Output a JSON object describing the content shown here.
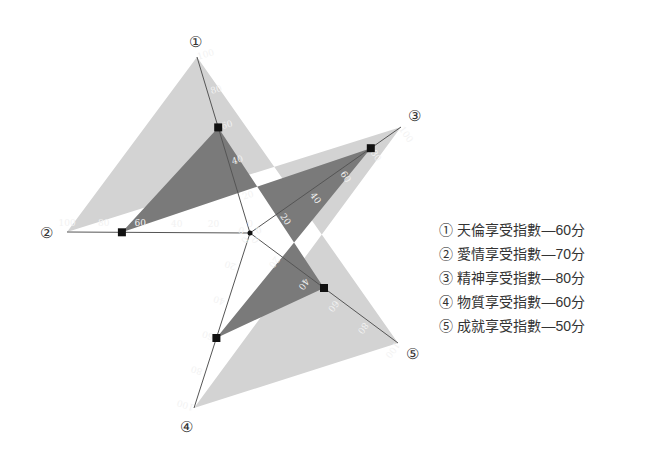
{
  "chart_data": {
    "type": "radar",
    "title": "",
    "categories": [
      "天倫享受指數",
      "愛情享受指數",
      "精神享受指數",
      "物質享受指數",
      "成就享受指數"
    ],
    "axis_markers": [
      "①",
      "②",
      "③",
      "④",
      "⑤"
    ],
    "series": [
      {
        "name": "享受指數",
        "values": [
          60,
          70,
          80,
          60,
          50
        ]
      }
    ],
    "range": [
      0,
      100
    ],
    "ticks": [
      0,
      20,
      40,
      60,
      80,
      100
    ],
    "grid": false,
    "legend_position": "right",
    "unit": "分",
    "colors": {
      "outer": "#d3d3d3",
      "inner": "#7a7a7a",
      "axis": "#555555",
      "marker": "#111111"
    }
  },
  "legend": [
    {
      "marker": "①",
      "label": "天倫享受指數",
      "value": "—60分"
    },
    {
      "marker": "②",
      "label": "愛情享受指數",
      "value": "—70分"
    },
    {
      "marker": "③",
      "label": "精神享受指數",
      "value": "—80分"
    },
    {
      "marker": "④",
      "label": "物質享受指數",
      "value": "—60分"
    },
    {
      "marker": "⑤",
      "label": "成就享受指數",
      "value": "—50分"
    }
  ]
}
